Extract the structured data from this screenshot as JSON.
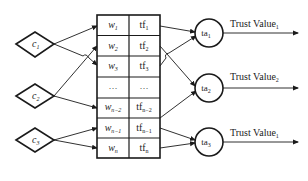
{
  "inputs": [
    {
      "id": "c1",
      "label": "c",
      "sub": "1"
    },
    {
      "id": "c2",
      "label": "c",
      "sub": "2"
    },
    {
      "id": "c3",
      "label": "c",
      "sub": "3"
    }
  ],
  "table": {
    "rows": [
      {
        "w": "w",
        "w_sub": "1",
        "tf": "tf",
        "tf_sub": "1"
      },
      {
        "w": "w",
        "w_sub": "2",
        "tf": "tf",
        "tf_sub": "2"
      },
      {
        "w": "w",
        "w_sub": "3",
        "tf": "tf",
        "tf_sub": "3"
      },
      {
        "w": "…",
        "w_sub": "",
        "tf": "…",
        "tf_sub": ""
      },
      {
        "w": "w",
        "w_sub": "n−2",
        "tf": "tf",
        "tf_sub": "n−2"
      },
      {
        "w": "w",
        "w_sub": "n−1",
        "tf": "tf",
        "tf_sub": "n−1"
      },
      {
        "w": "w",
        "w_sub": "n",
        "tf": "tf",
        "tf_sub": "n"
      }
    ]
  },
  "aggregators": [
    {
      "id": "ta1",
      "label": "ta",
      "sub": "1",
      "output": "Trust Value",
      "output_sub": "1"
    },
    {
      "id": "ta2",
      "label": "ta",
      "sub": "2",
      "output": "Trust Value",
      "output_sub": "2"
    },
    {
      "id": "ta3",
      "label": "ta",
      "sub": "3",
      "output": "Trust Value",
      "output_sub": "1"
    }
  ],
  "colors": {
    "stroke": "#1a1a1a",
    "background": "#ffffff"
  }
}
